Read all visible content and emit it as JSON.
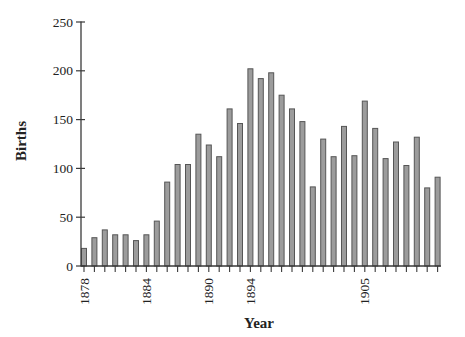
{
  "chart_data": {
    "type": "bar",
    "title": "",
    "xlabel": "Year",
    "ylabel": "Births",
    "categories": [
      1878,
      1879,
      1880,
      1881,
      1882,
      1883,
      1884,
      1885,
      1886,
      1887,
      1888,
      1889,
      1890,
      1891,
      1892,
      1893,
      1894,
      1895,
      1896,
      1897,
      1898,
      1899,
      1900,
      1901,
      1902,
      1903,
      1904,
      1905,
      1906,
      1907,
      1908,
      1909,
      1910,
      1911,
      1912
    ],
    "values": [
      18,
      29,
      37,
      32,
      32,
      26,
      32,
      46,
      86,
      104,
      104,
      135,
      124,
      112,
      161,
      146,
      202,
      192,
      198,
      175,
      161,
      148,
      81,
      130,
      112,
      143,
      113,
      169,
      141,
      110,
      127,
      103,
      132,
      80,
      91
    ],
    "x_tick_labels": [
      "1878",
      "1884",
      "1890",
      "1894",
      "1905"
    ],
    "y_ticks": [
      0,
      50,
      100,
      150,
      200,
      250
    ],
    "ylim": [
      0,
      250
    ],
    "grid": false,
    "legend": "none",
    "colors": {
      "bar_fill": "#9c9c9c",
      "bar_stroke": "#565656",
      "axis": "#3a3a3a",
      "text": "#222222"
    }
  }
}
